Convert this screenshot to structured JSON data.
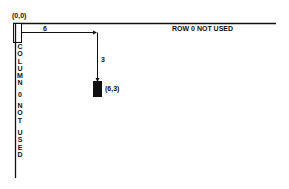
{
  "diagram": {
    "origin_label": "(0,0)",
    "row_label": "ROW 0 NOT USED",
    "column_label_letters": [
      "C",
      "O",
      "L",
      "U",
      "M",
      "N",
      " ",
      "0",
      " ",
      "N",
      "O",
      "T",
      " ",
      "U",
      "S",
      "E",
      "D"
    ],
    "column_label": "COLUMN 0 NOT USED",
    "horizontal_offset_label": "6",
    "vertical_offset_label": "3",
    "target_cell_label": "(6,3)",
    "colors": {
      "ink": "#111111",
      "background": "#ffffff"
    }
  }
}
